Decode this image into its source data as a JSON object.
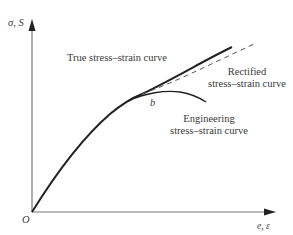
{
  "axes": {
    "y_label": "σ, S",
    "x_label": "e, ε",
    "origin_label": "O"
  },
  "curves": [
    {
      "name": "true",
      "label": "True stress–strain curve",
      "style": "solid-thick"
    },
    {
      "name": "rectified",
      "label_line1": "Rectified",
      "label_line2": "stress–strain curve",
      "style": "dashed"
    },
    {
      "name": "engineering",
      "label_line1": "Engineering",
      "label_line2": "stress–strain curve",
      "style": "solid"
    }
  ],
  "point_labels": {
    "b": "b"
  },
  "colors": {
    "axis": "#777777",
    "curve": "#222222",
    "dashed": "#555555",
    "text": "#3a3a3a"
  }
}
